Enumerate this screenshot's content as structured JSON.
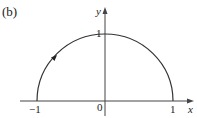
{
  "figure": {
    "panel_label": "(b)",
    "axes": {
      "x_label": "x",
      "y_label": "y",
      "x_ticks": [
        "−1",
        "0",
        "1"
      ],
      "y_ticks": [
        "1"
      ]
    },
    "curve": {
      "description": "upper semicircle of radius 1 centered at origin",
      "direction": "clockwise from (−1,0) through (0,1) to (1,0)",
      "arrow": "small arrowhead on left part of arc pointing along the curve"
    },
    "colors": {
      "line": "#333333",
      "background": "#ffffff"
    }
  }
}
